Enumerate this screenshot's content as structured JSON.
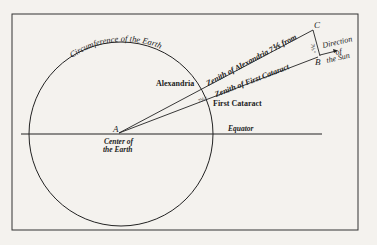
{
  "diagram": {
    "labels": {
      "circumference": "Circumference of the Earth",
      "alexandria": "Alexandria",
      "first_cataract": "First Cataract",
      "zenith_alexandria": "Zenith of Alexandria 7⅕ from",
      "zenith_first_cataract": "Zenith of First Cataract",
      "point_a": "A",
      "point_b": "B",
      "point_c": "C",
      "center_line1": "Center of",
      "center_line2": "the Earth",
      "equator": "Equator",
      "direction_line1": "Direction",
      "direction_line2": "of",
      "direction_line3": "the Sun",
      "angle_center": "7⅕°",
      "angle_bc": "7⅕°"
    },
    "colors": {
      "ink": "#222222",
      "paper": "#f4f2ee"
    }
  }
}
